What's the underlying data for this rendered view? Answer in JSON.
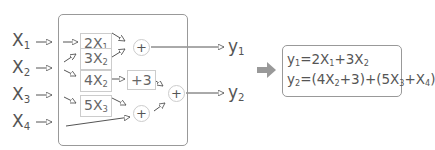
{
  "inputs": [
    {
      "name": "X",
      "sub": "1"
    },
    {
      "name": "X",
      "sub": "2"
    },
    {
      "name": "X",
      "sub": "3"
    },
    {
      "name": "X",
      "sub": "4"
    }
  ],
  "terms": [
    {
      "coef": "2X",
      "sub": "1"
    },
    {
      "coef": "3X",
      "sub": "2"
    },
    {
      "coef": "4X",
      "sub": "2"
    },
    {
      "coef": "5X",
      "sub": "3"
    }
  ],
  "constant": "+3",
  "sum_symbol": "+",
  "outputs": [
    {
      "name": "y",
      "sub": "1"
    },
    {
      "name": "y",
      "sub": "2"
    }
  ],
  "arrow_icon": "right-arrow-icon",
  "equations": {
    "y1": {
      "lhs": "y",
      "lhs_sub": "1",
      "p1": "=2X",
      "p1_sub": "1",
      "p2": "+3X",
      "p2_sub": "2"
    },
    "y2": {
      "lhs": "y",
      "lhs_sub": "2",
      "p1": "=(4X",
      "p1_sub": "2",
      "p2": "+3)+(5X",
      "p2_sub": "3",
      "p3": "+X",
      "p3_sub": "4",
      "p4": ")"
    }
  },
  "colors": {
    "line": "#555555",
    "box_border": "#999999",
    "term_border": "#cccccc",
    "arrow_fill": "#999999"
  }
}
